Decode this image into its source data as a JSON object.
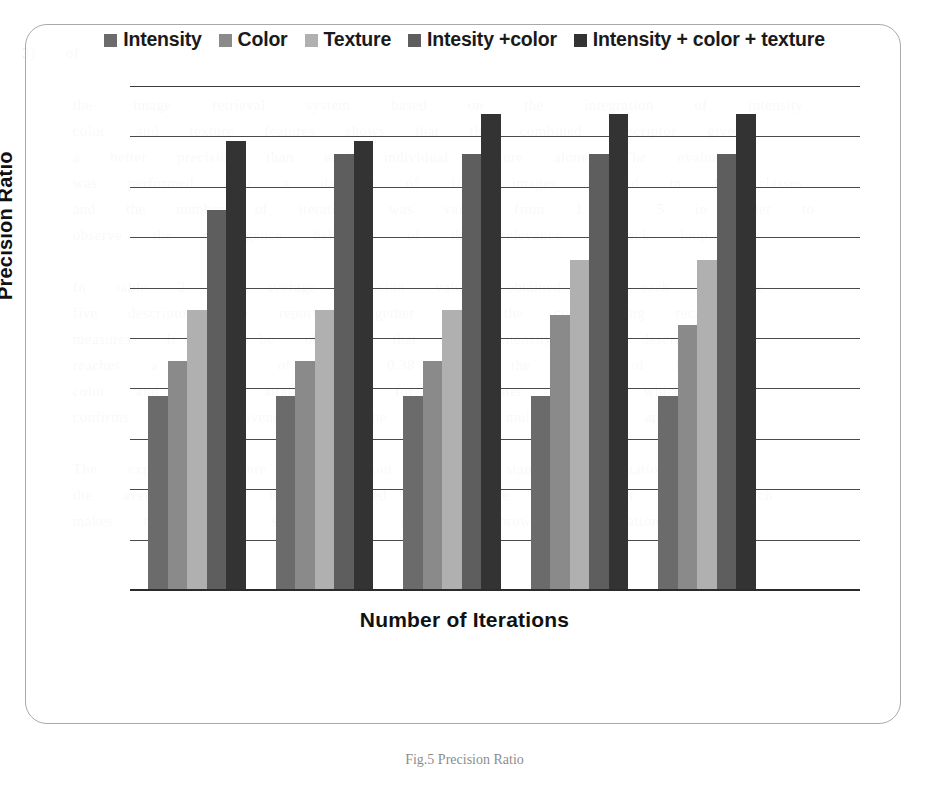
{
  "chart_data": {
    "type": "bar",
    "title": "",
    "xlabel": "Number of Iterations",
    "ylabel": "Precision Ratio",
    "grid": true,
    "legend_position": "top-center",
    "categories": [
      "1",
      "2",
      "3",
      "4",
      "5"
    ],
    "ylim": [
      0,
      1.0
    ],
    "y_gridline_count": 10,
    "series": [
      {
        "name": "Intensity",
        "color": "#6b6b6b",
        "values": [
          0.385,
          0.385,
          0.385,
          0.385,
          0.385
        ]
      },
      {
        "name": "Color",
        "color": "#8a8a8a",
        "values": [
          0.455,
          0.455,
          0.455,
          0.545,
          0.525
        ]
      },
      {
        "name": "Texture",
        "color": "#b0b0b0",
        "values": [
          0.555,
          0.555,
          0.555,
          0.655,
          0.655
        ]
      },
      {
        "name": "Intesity +color",
        "color": "#5e5e5e",
        "values": [
          0.755,
          0.865,
          0.865,
          0.865,
          0.865
        ]
      },
      {
        "name": "Intensity + color + texture",
        "color": "#333333",
        "values": [
          0.89,
          0.89,
          0.945,
          0.945,
          0.945
        ]
      }
    ]
  },
  "legend": {
    "items": [
      {
        "label": "Intensity",
        "swatch": "#6b6b6b"
      },
      {
        "label": "Color",
        "swatch": "#8a8a8a"
      },
      {
        "label": "Texture",
        "swatch": "#b0b0b0"
      },
      {
        "label": "Intesity +color",
        "swatch": "#5e5e5e"
      },
      {
        "label": "Intensity + color + texture",
        "swatch": "#333333"
      }
    ]
  },
  "axes": {
    "y_title": "Precision Ratio",
    "x_title": "Number of Iterations"
  },
  "caption": "Fig.5  Precision Ratio",
  "ghost_text": "                                                                                                                   3)   of\n\n     the    image    retrieval    system    based    on    the    integration    of    intensity\n     color   and   texture   features   shows   that   the   combined   descriptor   gives\n     a   better   precision   than   each   individual   feature   alone.   The   evaluation\n     was   performed   over   a   database   of   1000   images   grouped   in   10   classes\n     and   the   number   of   iterations   was   varied   from   1   to   5   in   order   to\n     observe   the   convergence   behaviour   of   the   relevance   feedback   loop.\n\n     In   table   2   the   average   precision   values   obtained   for   each   of   the\n     five   descriptors   are   reported   together   with   the   corresponding   recall\n     measures.   It   can   be   observed   that   the   intensity   only   descriptor\n     reaches   a   precision   of   about   0.38   while   the   fusion   of   intensity\n     color   and   texture   attains   0.94   for   the   later   iterations   which\n     confirms   the   effectiveness   of   the   proposed   multi   feature   approach.\n\n     The   experiments   were   carried   out   on   a   standard   workstation   and\n     the   average   query   time   remained   below   one   second   per   image   which\n     makes   the   method   suitable   for   interactive   browsing   applications.\n\n\n\n\n\n\n\n\n\n\n\n\n\n\n\n\n\n\n\n\n     Zhou   et   al.   applied   a   similar   strategy   to   the   problem   of   region\n     based   retrieval   and   obtained   comparable   results   on   the   same   data."
}
